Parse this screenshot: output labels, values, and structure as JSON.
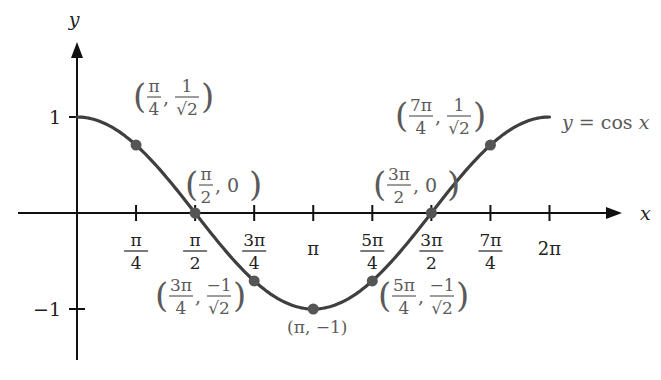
{
  "chart_data": {
    "type": "line",
    "title": "",
    "function_label": "y = cos x",
    "xlabel": "x",
    "ylabel": "y",
    "xlim": [
      0,
      6.2832
    ],
    "ylim": [
      -1,
      1
    ],
    "grid": false,
    "x_ticks": [
      {
        "value": 0.7854,
        "num": "π",
        "den": "4"
      },
      {
        "value": 1.5708,
        "num": "π",
        "den": "2"
      },
      {
        "value": 2.3562,
        "num": "3π",
        "den": "4"
      },
      {
        "value": 3.1416,
        "num": "π",
        "den": ""
      },
      {
        "value": 3.927,
        "num": "5π",
        "den": "4"
      },
      {
        "value": 4.7124,
        "num": "3π",
        "den": "2"
      },
      {
        "value": 5.4978,
        "num": "7π",
        "den": "4"
      },
      {
        "value": 6.2832,
        "num": "2π",
        "den": ""
      }
    ],
    "y_ticks": [
      {
        "value": 1,
        "label": "1"
      },
      {
        "value": -1,
        "label": "−1"
      }
    ],
    "series": [
      {
        "name": "y = cos x",
        "x": [
          0,
          0.7854,
          1.5708,
          2.3562,
          3.1416,
          3.927,
          4.7124,
          5.4978,
          6.2832
        ],
        "y": [
          1,
          0.7071,
          0,
          -0.7071,
          -1,
          -0.7071,
          0,
          0.7071,
          1
        ]
      }
    ],
    "marked_points": [
      {
        "x": 0.7854,
        "y": 0.7071,
        "label_x_num": "π",
        "label_x_den": "4",
        "label_y_num": "1",
        "label_y_den": "√2"
      },
      {
        "x": 1.5708,
        "y": 0,
        "label_x_num": "π",
        "label_x_den": "2",
        "label_y": "0"
      },
      {
        "x": 2.3562,
        "y": -0.7071,
        "label_x_num": "3π",
        "label_x_den": "4",
        "label_y_num": "−1",
        "label_y_den": "√2"
      },
      {
        "x": 3.1416,
        "y": -1,
        "label": "(π, −1)"
      },
      {
        "x": 3.927,
        "y": -0.7071,
        "label_x_num": "5π",
        "label_x_den": "4",
        "label_y_num": "−1",
        "label_y_den": "√2"
      },
      {
        "x": 4.7124,
        "y": 0,
        "label_x_num": "3π",
        "label_x_den": "2",
        "label_y": "0"
      },
      {
        "x": 5.4978,
        "y": 0.7071,
        "label_x_num": "7π",
        "label_x_den": "4",
        "label_y_num": "1",
        "label_y_den": "√2"
      }
    ]
  },
  "layout": {
    "origin_px": [
      77,
      213
    ],
    "x_scale_px_per_unit": 75.2,
    "y_scale_px_per_unit": 96,
    "x_axis_from": 18,
    "x_axis_to": 622,
    "y_axis_from": 360,
    "y_axis_to": 42
  },
  "colors": {
    "axis": "#111111",
    "curve": "#3f3f3f",
    "point": "#555555",
    "label": "#5a5a5a"
  }
}
